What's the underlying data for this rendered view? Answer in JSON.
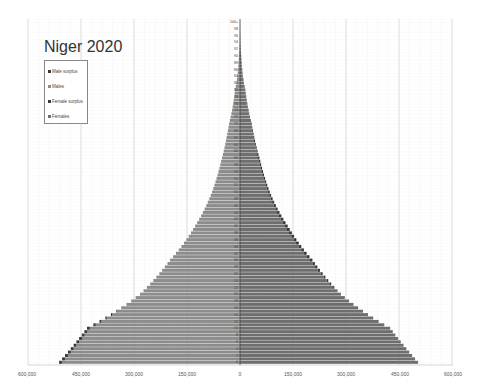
{
  "chart_data": {
    "type": "bar",
    "orientation": "horizontal",
    "subtype": "population-pyramid",
    "title": "Niger 2020",
    "xlabel": "",
    "ylabel": "Age",
    "xlim": [
      -600000,
      600000
    ],
    "x_ticks": [
      "600,000",
      "450,000",
      "300,000",
      "150,000",
      "0",
      "150,000",
      "300,000",
      "450,000",
      "600,000"
    ],
    "x_tick_values": [
      -600000,
      -450000,
      -300000,
      -150000,
      0,
      150000,
      300000,
      450000,
      600000
    ],
    "grid": true,
    "legend_position": "upper-left",
    "legend": [
      "Male surplus",
      "Males",
      "Female surplus",
      "Females"
    ],
    "colors": {
      "male_surplus": "#3a3a3a",
      "males": "#8c8c8c",
      "female_surplus": "#3a3a3a",
      "females": "#6e6e6e"
    },
    "age_labels_note": "Ages 0 to 100+, labeled every 2 years",
    "top_age_label": "100+",
    "anchor_points": {
      "ages": [
        0,
        10,
        20,
        30,
        40,
        50,
        60,
        70,
        80,
        90,
        100
      ],
      "males": [
        512000,
        433000,
        283000,
        198000,
        127000,
        79000,
        51000,
        31000,
        14000,
        3000,
        200
      ],
      "females": [
        504000,
        425000,
        285000,
        205000,
        135000,
        84000,
        55000,
        33000,
        15000,
        3500,
        300
      ]
    }
  },
  "labels": {
    "title": "Niger 2020",
    "legend": [
      "Male surplus",
      "Males",
      "Female surplus",
      "Females"
    ],
    "x_ticks": [
      "600,000",
      "450,000",
      "300,000",
      "150,000",
      "0",
      "150,000",
      "300,000",
      "450,000",
      "600,000"
    ]
  }
}
